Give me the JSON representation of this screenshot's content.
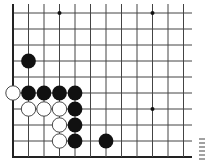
{
  "diagram": {
    "type": "go-board-fragment",
    "columns": 12,
    "rows": 10,
    "edges": {
      "left": true,
      "bottom": true,
      "top": false,
      "right": false
    },
    "colors": {
      "line": "#444444",
      "edge": "#222222",
      "black_stone": "#111111",
      "white_stone": "#ffffff",
      "white_outline": "#333333"
    },
    "star_points": [
      {
        "col": 3,
        "row": 0
      },
      {
        "col": 9,
        "row": 0
      },
      {
        "col": 9,
        "row": 6
      }
    ],
    "stones": [
      {
        "color": "black",
        "col": 1,
        "row": 3
      },
      {
        "color": "white",
        "col": 0,
        "row": 5
      },
      {
        "color": "black",
        "col": 1,
        "row": 5
      },
      {
        "color": "black",
        "col": 2,
        "row": 5
      },
      {
        "color": "black",
        "col": 3,
        "row": 5
      },
      {
        "color": "black",
        "col": 4,
        "row": 5
      },
      {
        "color": "white",
        "col": 1,
        "row": 6
      },
      {
        "color": "white",
        "col": 2,
        "row": 6
      },
      {
        "color": "white",
        "col": 3,
        "row": 6
      },
      {
        "color": "black",
        "col": 4,
        "row": 6
      },
      {
        "color": "white",
        "col": 3,
        "row": 7
      },
      {
        "color": "black",
        "col": 4,
        "row": 7
      },
      {
        "color": "white",
        "col": 3,
        "row": 8
      },
      {
        "color": "black",
        "col": 4,
        "row": 8
      },
      {
        "color": "black",
        "col": 6,
        "row": 8
      }
    ]
  }
}
